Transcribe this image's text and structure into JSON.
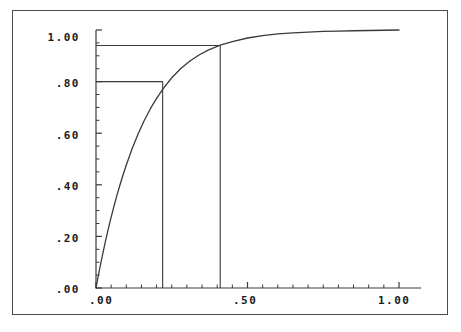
{
  "figure": {
    "background_color": "#ffffff",
    "frame_color": "#4a4a4a",
    "curve_color": "#3a3a3a",
    "axis_color": "#3a3a3a",
    "reference_line_color": "#3a3a3a"
  },
  "chart_data": {
    "type": "line",
    "title": "",
    "subtitle": "",
    "xlabel": "",
    "ylabel": "",
    "xlim": [
      0.0,
      1.0
    ],
    "ylim": [
      0.0,
      1.0
    ],
    "grid": false,
    "legend": null,
    "x_ticks": [
      {
        "value": 0.0,
        "label": ".00"
      },
      {
        "value": 0.5,
        "label": ".50"
      },
      {
        "value": 1.0,
        "label": "1.00"
      }
    ],
    "y_ticks": [
      {
        "value": 0.0,
        "label": ".00"
      },
      {
        "value": 0.2,
        "label": ".20"
      },
      {
        "value": 0.4,
        "label": ".40"
      },
      {
        "value": 0.6,
        "label": ".60"
      },
      {
        "value": 0.8,
        "label": ".80"
      },
      {
        "value": 1.0,
        "label": "1.00"
      }
    ],
    "x_minor_tick_count": 20,
    "y_minor_tick_count": 20,
    "series": [
      {
        "name": "cumulative-curve",
        "type": "line",
        "x": [
          0.0,
          0.01,
          0.02,
          0.03,
          0.04,
          0.05,
          0.06,
          0.07,
          0.08,
          0.09,
          0.1,
          0.12,
          0.14,
          0.16,
          0.18,
          0.2,
          0.22,
          0.25,
          0.28,
          0.31,
          0.34,
          0.37,
          0.41,
          0.45,
          0.5,
          0.55,
          0.6,
          0.65,
          0.7,
          0.75,
          0.8,
          0.85,
          0.9,
          0.95,
          1.0
        ],
        "y": [
          0.0,
          0.062,
          0.12,
          0.175,
          0.226,
          0.275,
          0.32,
          0.363,
          0.403,
          0.441,
          0.477,
          0.543,
          0.6,
          0.651,
          0.696,
          0.735,
          0.77,
          0.815,
          0.851,
          0.88,
          0.903,
          0.922,
          0.941,
          0.955,
          0.969,
          0.978,
          0.985,
          0.989,
          0.992,
          0.995,
          0.996,
          0.997,
          0.998,
          0.999,
          1.0
        ]
      }
    ],
    "annotations": [
      {
        "name": "lower-reference",
        "type": "crosshair",
        "x": 0.22,
        "y": 0.8,
        "horizontal_from_x": 0.0,
        "vertical_to_y": 0.0
      },
      {
        "name": "upper-reference",
        "type": "crosshair",
        "x": 0.41,
        "y": 0.94,
        "horizontal_from_x": 0.0,
        "vertical_to_y": 0.0
      }
    ]
  }
}
